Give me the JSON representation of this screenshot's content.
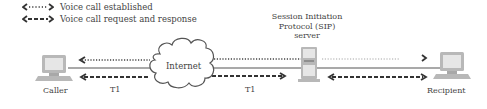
{
  "legend": {
    "items": [
      {
        "label": "Voice call established",
        "style": "dotted"
      },
      {
        "label": "Voice call request and response",
        "style": "dashed"
      }
    ]
  },
  "nodes": {
    "caller": {
      "label": "Caller"
    },
    "internet": {
      "label": "Internet"
    },
    "sip_server": {
      "label_line1": "Session Initiation",
      "label_line2": "Protocol (SIP)",
      "label_line3": "server"
    },
    "recipient": {
      "label": "Recipient"
    }
  },
  "links": {
    "caller_internet": {
      "label": "T1"
    },
    "internet_server": {
      "label": "T1"
    }
  },
  "colors": {
    "line": "#555555",
    "arrow": "#333333",
    "device": "#b8b8b8",
    "screen": "#e6e6e6"
  }
}
